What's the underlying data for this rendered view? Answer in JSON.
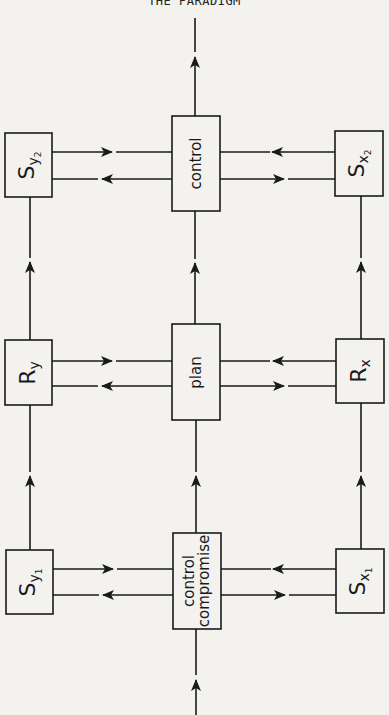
{
  "page": {
    "title": "THE PARADIGM"
  },
  "nodes": {
    "control": {
      "label": "control"
    },
    "plan": {
      "label": "plan"
    },
    "control_compromise": {
      "line1": "control",
      "line2": "compromise"
    },
    "sy2": {
      "base": "S",
      "sub": "y",
      "subsub": "2"
    },
    "sx2": {
      "base": "S",
      "sub": "x",
      "subsub": "2"
    },
    "ry": {
      "base": "R",
      "sub": "y"
    },
    "rx": {
      "base": "R",
      "sub": "x"
    },
    "sy1": {
      "base": "S",
      "sub": "y",
      "subsub": "1"
    },
    "sx1": {
      "base": "S",
      "sub": "x",
      "subsub": "1"
    }
  },
  "colors": {
    "background": "#f3f2ef",
    "ink": "#1a1a1a"
  }
}
